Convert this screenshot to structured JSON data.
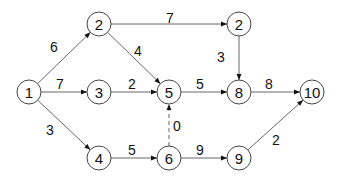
{
  "diagram": {
    "type": "directed-weighted-network",
    "nodes": [
      {
        "id": "n1",
        "label": "1",
        "x": 29,
        "y": 92
      },
      {
        "id": "n2a",
        "label": "2",
        "x": 99,
        "y": 24
      },
      {
        "id": "n3",
        "label": "3",
        "x": 99,
        "y": 92
      },
      {
        "id": "n5",
        "label": "5",
        "x": 169,
        "y": 92
      },
      {
        "id": "n2b",
        "label": "2",
        "x": 239,
        "y": 24
      },
      {
        "id": "n8",
        "label": "8",
        "x": 239,
        "y": 92
      },
      {
        "id": "n10",
        "label": "10",
        "x": 312,
        "y": 92
      },
      {
        "id": "n4",
        "label": "4",
        "x": 99,
        "y": 158
      },
      {
        "id": "n6",
        "label": "6",
        "x": 169,
        "y": 158
      },
      {
        "id": "n9",
        "label": "9",
        "x": 239,
        "y": 158
      }
    ],
    "edges": [
      {
        "from": "n1",
        "to": "n2a",
        "weight": "6",
        "lx": 54,
        "ly": 47,
        "dashed": false
      },
      {
        "from": "n1",
        "to": "n3",
        "weight": "7",
        "lx": 60,
        "ly": 84,
        "dashed": false
      },
      {
        "from": "n1",
        "to": "n4",
        "weight": "3",
        "lx": 50,
        "ly": 130,
        "dashed": false
      },
      {
        "from": "n2a",
        "to": "n2b",
        "weight": "7",
        "lx": 170,
        "ly": 18,
        "dashed": false
      },
      {
        "from": "n2a",
        "to": "n5",
        "weight": "4",
        "lx": 138,
        "ly": 51,
        "dashed": false
      },
      {
        "from": "n3",
        "to": "n5",
        "weight": "2",
        "lx": 132,
        "ly": 84,
        "dashed": false
      },
      {
        "from": "n5",
        "to": "n8",
        "weight": "5",
        "lx": 200,
        "ly": 84,
        "dashed": false
      },
      {
        "from": "n2b",
        "to": "n8",
        "weight": "3",
        "lx": 221,
        "ly": 57,
        "dashed": false
      },
      {
        "from": "n8",
        "to": "n10",
        "weight": "8",
        "lx": 269,
        "ly": 84,
        "dashed": false
      },
      {
        "from": "n4",
        "to": "n6",
        "weight": "5",
        "lx": 132,
        "ly": 150,
        "dashed": false
      },
      {
        "from": "n6",
        "to": "n5",
        "weight": "0",
        "lx": 177,
        "ly": 126,
        "dashed": true
      },
      {
        "from": "n6",
        "to": "n9",
        "weight": "9",
        "lx": 200,
        "ly": 150,
        "dashed": false
      },
      {
        "from": "n9",
        "to": "n10",
        "weight": "2",
        "lx": 276,
        "ly": 140,
        "dashed": false
      }
    ]
  }
}
